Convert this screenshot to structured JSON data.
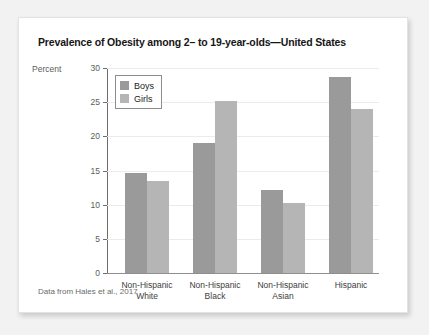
{
  "chart_data": {
    "type": "bar",
    "title": "Prevalence of Obesity among 2– to 19-year-olds—United States",
    "xlabel": "",
    "ylabel": "Percent",
    "ylim": [
      0,
      30
    ],
    "yticks": [
      0,
      5,
      10,
      15,
      20,
      25,
      30
    ],
    "grid": true,
    "legend_position": "top-left-inside",
    "source_note": "Data from Hales et al., 2017",
    "categories": [
      "Non-Hispanic White",
      "Non-Hispanic Black",
      "Non-Hispanic Asian",
      "Hispanic"
    ],
    "category_lines": [
      [
        "Non-Hispanic",
        "White"
      ],
      [
        "Non-Hispanic",
        "Black"
      ],
      [
        "Non-Hispanic",
        "Asian"
      ],
      [
        "Hispanic",
        ""
      ]
    ],
    "series": [
      {
        "name": "Boys",
        "color": "#9a9a9a",
        "values": [
          14.7,
          19.0,
          12.2,
          28.7
        ]
      },
      {
        "name": "Girls",
        "color": "#b5b5b5",
        "values": [
          13.5,
          25.1,
          10.2,
          24.0
        ]
      }
    ]
  }
}
